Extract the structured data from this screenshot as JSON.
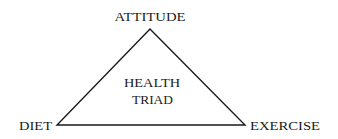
{
  "diagram": {
    "type": "triangle",
    "stroke_color": "#1a1a1a",
    "background": "#ffffff",
    "vertices": {
      "top": {
        "label": "ATTITUDE",
        "x": 150,
        "y": 29
      },
      "left": {
        "label": "DIET",
        "x": 57,
        "y": 125
      },
      "right": {
        "label": "EXERCISE",
        "x": 245,
        "y": 125
      }
    },
    "center_label": {
      "line1": "HEALTH",
      "line2": "TRIAD"
    }
  }
}
